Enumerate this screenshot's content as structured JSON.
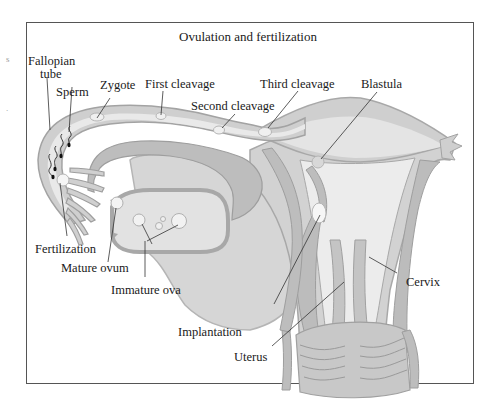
{
  "figure": {
    "title": "Ovulation and fertilization",
    "colors": {
      "tissue_fill": "#d4d4d4",
      "tissue_light": "#e6e6e6",
      "wall": "#b3b3b3",
      "wall_stroke": "#9a9a9a",
      "lumen": "#efefef",
      "leader": "#333333",
      "frame": "#555555"
    },
    "labels": {
      "fallopian_tube": [
        "Fallopian",
        "tube"
      ],
      "sperm": "Sperm",
      "zygote": "Zygote",
      "first_cleavage": "First cleavage",
      "second_cleavage": "Second cleavage",
      "third_cleavage": "Third cleavage",
      "blastula": "Blastula",
      "fertilization": "Fertilization",
      "mature_ovum": "Mature ovum",
      "immature_ova": "Immature ova",
      "implantation": "Implantation",
      "uterus": "Uterus",
      "cervix": "Cervix"
    },
    "margin_fragments": [
      "s",
      "."
    ]
  }
}
